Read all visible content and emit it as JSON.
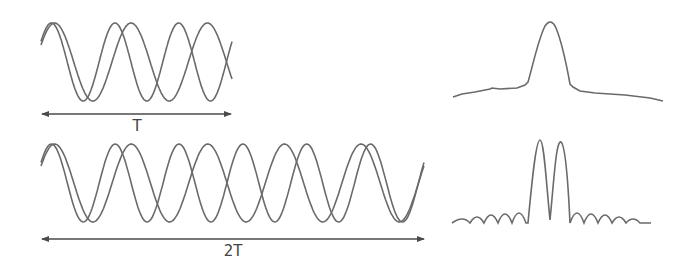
{
  "diagram": {
    "top_row": {
      "period_label": "T",
      "description": "Two sinusoids of slightly different frequency over duration T",
      "spectrum": "single broad peak"
    },
    "bottom_row": {
      "period_label": "2T",
      "description": "Two sinusoids of slightly different frequency over duration 2T",
      "spectrum": "two resolved narrow peaks with side lobes"
    },
    "colors": {
      "line": "#6a6a6a",
      "arrow": "#4a4a4a",
      "background": "#ffffff"
    }
  }
}
